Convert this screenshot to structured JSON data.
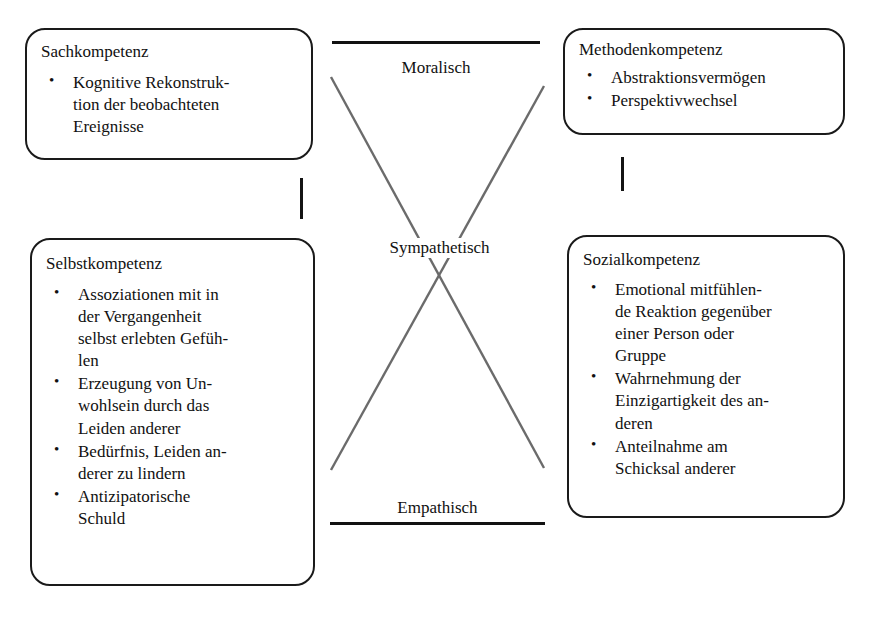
{
  "diagram": {
    "boxes": [
      {
        "id": "sachkompetenz",
        "title": "Sachkompetenz",
        "bullets": [
          "Kognitive Rekonstruk-\ntion der beobachteten\nEreignisse"
        ]
      },
      {
        "id": "methodenkompetenz",
        "title": "Methodenkompetenz",
        "bullets": [
          "Abstraktionsvermögen",
          "Perspektivwechsel"
        ]
      },
      {
        "id": "selbstkompetenz",
        "title": "Selbstkompetenz",
        "bullets": [
          "Assoziationen mit in\nder Vergangenheit\nselbst erlebten Gefüh-\nlen",
          "Erzeugung von Un-\nwohlsein durch das\nLeiden anderer",
          "Bedürfnis, Leiden an-\nderer zu lindern",
          "Antizipatorische\nSchuld"
        ]
      },
      {
        "id": "sozialkompetenz",
        "title": "Sozialkompetenz",
        "bullets": [
          "Emotional mitfühlen-\nde Reaktion gegenüber\neiner Person oder\nGruppe",
          "Wahrnehmung der\nEinzigartigkeit des an-\nderen",
          "Anteilnahme am\nSchicksal anderer"
        ]
      }
    ],
    "axis_labels": {
      "top": "Moralisch",
      "center": "Sympathetisch",
      "bottom": "Empathisch"
    },
    "colors": {
      "box_border": "#1a1a1a",
      "bar": "#121212",
      "cross_line": "#6b6b6b",
      "text": "#111111",
      "background": "#ffffff"
    }
  }
}
